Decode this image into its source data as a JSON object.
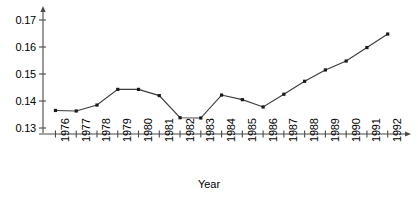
{
  "chart_data": {
    "type": "line",
    "title": "",
    "xlabel": "Year",
    "ylabel": "",
    "categories": [
      "1976",
      "1977",
      "1978",
      "1979",
      "1980",
      "1981",
      "1982",
      "1983",
      "1984",
      "1985",
      "1986",
      "1987",
      "1988",
      "1989",
      "1990",
      "1991",
      "1992"
    ],
    "values": [
      0.1365,
      0.1363,
      0.1385,
      0.1443,
      0.1443,
      0.142,
      0.1338,
      0.1337,
      0.1422,
      0.1405,
      0.1378,
      0.1425,
      0.1473,
      0.1515,
      0.1548,
      0.1598,
      0.1648
    ],
    "series": [
      {
        "name": "series-1",
        "values": [
          0.1365,
          0.1363,
          0.1385,
          0.1443,
          0.1443,
          0.142,
          0.1338,
          0.1337,
          0.1422,
          0.1405,
          0.1378,
          0.1425,
          0.1473,
          0.1515,
          0.1548,
          0.1598,
          0.1648
        ]
      }
    ],
    "ylim": [
      0.13,
      0.17
    ],
    "yticks": [
      0.13,
      0.14,
      0.15,
      0.16,
      0.17
    ],
    "ytick_labels": [
      "0.13",
      "0.14",
      "0.15",
      "0.16",
      "0.17"
    ],
    "grid": false,
    "legend": null,
    "marker": "square",
    "line_color": "#3a3a3a",
    "marker_color": "#1a1a1a",
    "axis_color": "#4a4a4a"
  },
  "axis": {
    "x_title": "Year"
  }
}
